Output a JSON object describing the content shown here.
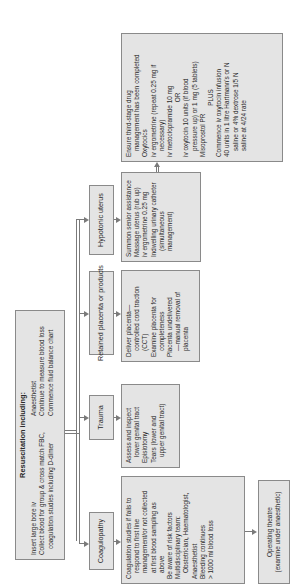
{
  "resuscitation": {
    "title": "Resuscitation including:",
    "left_lines": [
      "Insert large bore iv",
      "Collect blood for group & cross match FBC,",
      "coagulation studies including D-dimer"
    ],
    "right_lines": [
      "Anaesthetist",
      "Continue to measure blood  loss",
      "Commence fluid balance chart"
    ]
  },
  "causes": [
    {
      "label": "Coagulopathy"
    },
    {
      "label": "Trauma"
    },
    {
      "label": "Retained placenta or products"
    },
    {
      "label": "Hypotonic uterus"
    }
  ],
  "coagulopathy_detail": {
    "lines": [
      "Coagulation studies if fails to",
      "respond to first line",
      "management/or not collected",
      "at first blood sampling as",
      "above",
      "Be aware of risk factors",
      "Multidisciplinary team:",
      "Obstetrician, Haematologist,",
      "Anaesthetist",
      "Bleeding continues",
      "> 1000 ml blood loss"
    ]
  },
  "operating_theatre": {
    "lines": [
      "Operating theatre",
      "(examine under anaesthetic)"
    ]
  },
  "trauma_detail": {
    "lines": [
      "Assess and inspect",
      "lower genital tract",
      "Episiotomy",
      "Tears (lower and",
      "upper genital tract)"
    ]
  },
  "retained_detail": {
    "lines": [
      "Deliver placenta—",
      "controlled cord traction",
      "(CCT)",
      "Examine placenta for",
      "completeness",
      "Placenta undelivered",
      "—manual removal of",
      "placenta"
    ]
  },
  "hypotonic_detail": {
    "lines": [
      "Summon senior assistance",
      "Massage uterus (rub up)",
      "iv ergometrine 0.25 mg",
      "Indwelling urinary catheter",
      "(simultaneous",
      "management)"
    ]
  },
  "oxytocics": {
    "lines": [
      "Ensure third-stage drug",
      "management has been completed",
      "Oxytocics",
      "iv ergometrine (repeat 0.25 mg if",
      "necessary)",
      "iv metoclopramide 10 mg",
      "OR",
      "iv oxytocin 10 units (if blood",
      "pressure up) or 1 mg (5 tablets)",
      "Misoprostol PR",
      "PLUS",
      "Commence iv oxytocin infusion",
      "40 units in 1 litre Hartmann's or N",
      "saline or 4% dextrose 1/5 N",
      "saline at 4/24 rate"
    ]
  },
  "colors": {
    "box_fill": "#e4e4e4",
    "box_border": "#8a8a8a",
    "connector": "#7a7a7a",
    "text": "#2a2a2a"
  }
}
